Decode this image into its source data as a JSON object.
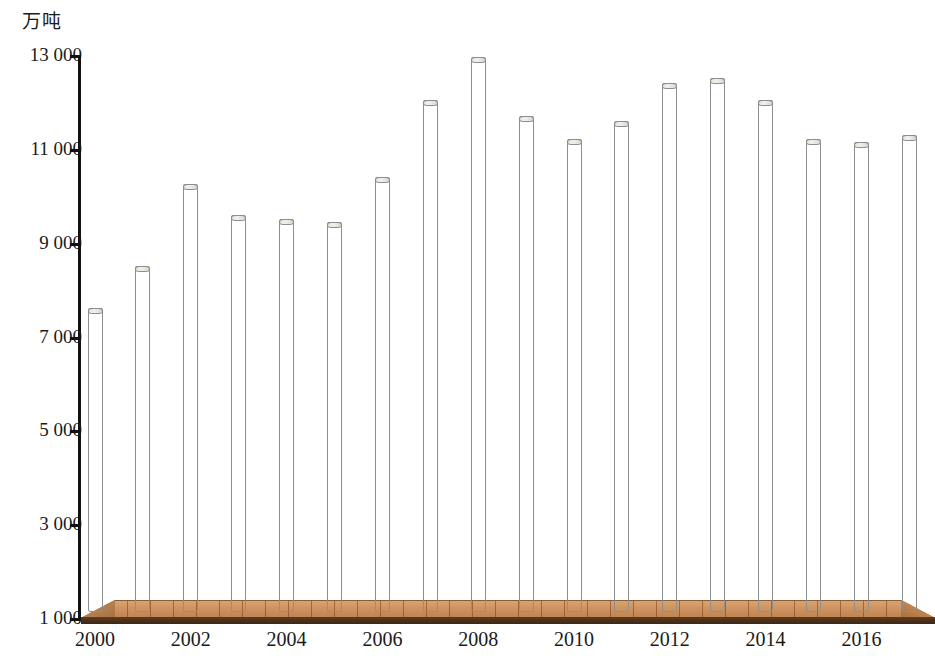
{
  "chart_data": {
    "type": "bar",
    "title": "",
    "subtitle": "",
    "unit_label": "万吨",
    "xlabel": "",
    "ylabel": "万吨",
    "ylim": [
      1000,
      13000
    ],
    "y_ticks": [
      "1 000",
      "3 000",
      "5 000",
      "7 000",
      "9 000",
      "11 000",
      "13 000"
    ],
    "y_tick_values": [
      1000,
      3000,
      5000,
      7000,
      9000,
      11000,
      13000
    ],
    "grid": false,
    "legend": "none",
    "x_tick_labels": [
      "2000",
      "2002",
      "2004",
      "2006",
      "2008",
      "2010",
      "2012",
      "2014",
      "2016"
    ],
    "categories": [
      "2000",
      "2001",
      "2002",
      "2003",
      "2004",
      "2005",
      "2006",
      "2007",
      "2008",
      "2009",
      "2010",
      "2011",
      "2012",
      "2013",
      "2014",
      "2015",
      "2016",
      "2017"
    ],
    "values": [
      7600,
      8500,
      10250,
      9600,
      9500,
      9450,
      10400,
      12050,
      12950,
      11700,
      11200,
      11600,
      12400,
      12500,
      12050,
      11200,
      11150,
      11300
    ],
    "bars": [
      {
        "category": "2000",
        "value": 7600,
        "show_label": true
      },
      {
        "category": "2001",
        "value": 8500,
        "show_label": false
      },
      {
        "category": "2002",
        "value": 10250,
        "show_label": true
      },
      {
        "category": "2003",
        "value": 9600,
        "show_label": false
      },
      {
        "category": "2004",
        "value": 9500,
        "show_label": true
      },
      {
        "category": "2005",
        "value": 9450,
        "show_label": false
      },
      {
        "category": "2006",
        "value": 10400,
        "show_label": true
      },
      {
        "category": "2007",
        "value": 12050,
        "show_label": false
      },
      {
        "category": "2008",
        "value": 12950,
        "show_label": true
      },
      {
        "category": "2009",
        "value": 11700,
        "show_label": false
      },
      {
        "category": "2010",
        "value": 11200,
        "show_label": true
      },
      {
        "category": "2011",
        "value": 11600,
        "show_label": false
      },
      {
        "category": "2012",
        "value": 12400,
        "show_label": true
      },
      {
        "category": "2013",
        "value": 12500,
        "show_label": false
      },
      {
        "category": "2014",
        "value": 12050,
        "show_label": true
      },
      {
        "category": "2015",
        "value": 11200,
        "show_label": false
      },
      {
        "category": "2016",
        "value": 11150,
        "show_label": true
      },
      {
        "category": "2017",
        "value": 11300,
        "show_label": false
      }
    ],
    "colors": {
      "bar_light": "#fdf4ea",
      "bar_mid": "#f6cda9",
      "bar_dark": "#c98e5d",
      "bar_outline": "#8e8e8e",
      "floor": "#cd9360",
      "floor_shadow": "#3c2614",
      "axis": "#111111",
      "text": "#1a1a1a"
    }
  }
}
